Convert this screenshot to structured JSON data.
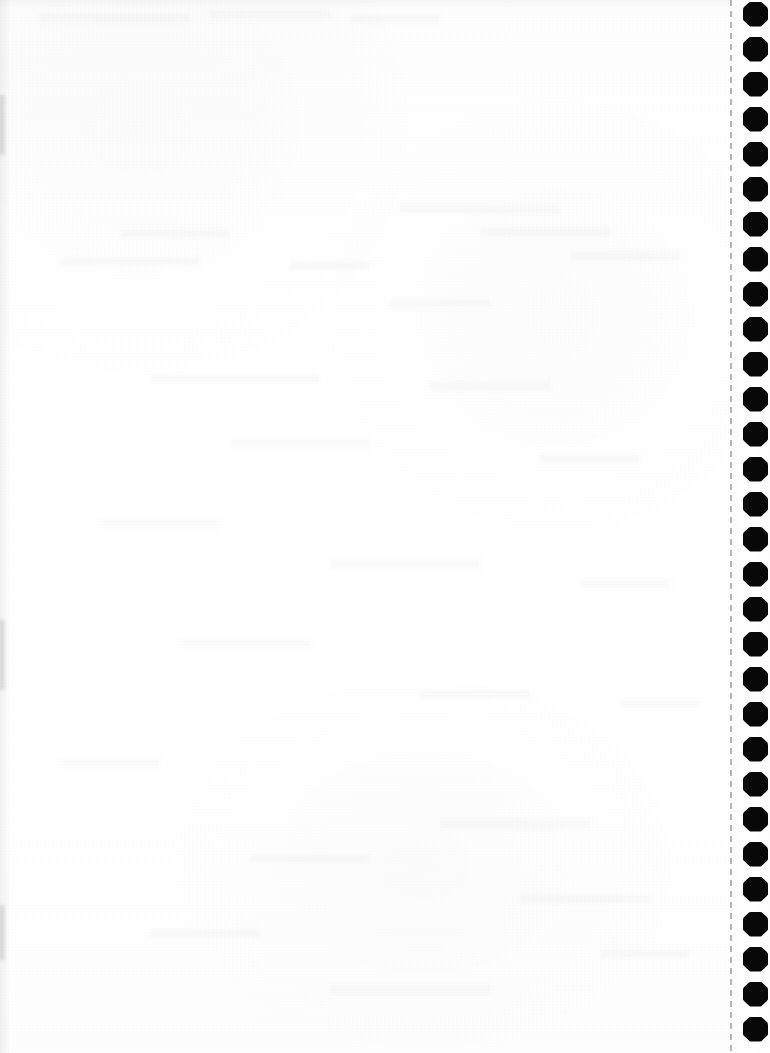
{
  "document": {
    "kind": "scanned-continuous-feed-paper",
    "title": "Blank Scanned Page",
    "page_width": 770,
    "page_height": 1053,
    "body_text": "",
    "visible_text": "",
    "notes_label": ""
  },
  "colors": {
    "paper": "#fefefe",
    "paper_shade": "#fdfdfd",
    "sprocket_hole": "#080808",
    "perforation": "#9a9a9a",
    "bleed_through": "rgba(120,120,130,0.035)"
  },
  "paper_body": {
    "name": "blank writing area",
    "left": 0,
    "top": 0,
    "width": 731,
    "height": 1053,
    "content": ""
  },
  "feed_strip": {
    "name": "tractor feed tear-off strip",
    "left": 731,
    "width": 39,
    "label": ""
  },
  "perforation": {
    "name": "dashed perforation line",
    "x": 730,
    "dash_length": 6,
    "gap_length": 5,
    "color": "#9a9a9a"
  },
  "sprockets": {
    "name": "sprocket feed holes",
    "count": 30,
    "left": 743,
    "size": 25,
    "pitch": 35,
    "first_center_y": 14,
    "centers_y": [
      14,
      49,
      84,
      119,
      154,
      189,
      224,
      259,
      294,
      329,
      364,
      399,
      434,
      469,
      504,
      539,
      574,
      609,
      644,
      679,
      714,
      749,
      784,
      819,
      854,
      889,
      924,
      959,
      994,
      1029
    ]
  },
  "bleed_through_marks": [
    {
      "left": 40,
      "top": 14,
      "width": 150,
      "height": 9
    },
    {
      "left": 210,
      "top": 10,
      "width": 120,
      "height": 8
    },
    {
      "left": 350,
      "top": 16,
      "width": 90,
      "height": 7
    },
    {
      "left": 400,
      "top": 205,
      "width": 160,
      "height": 8
    },
    {
      "left": 120,
      "top": 230,
      "width": 110,
      "height": 7
    },
    {
      "left": 480,
      "top": 228,
      "width": 130,
      "height": 8
    },
    {
      "left": 60,
      "top": 258,
      "width": 140,
      "height": 7
    },
    {
      "left": 290,
      "top": 262,
      "width": 80,
      "height": 7
    },
    {
      "left": 570,
      "top": 252,
      "width": 110,
      "height": 8
    },
    {
      "left": 390,
      "top": 300,
      "width": 100,
      "height": 7
    },
    {
      "left": 150,
      "top": 375,
      "width": 170,
      "height": 7
    },
    {
      "left": 430,
      "top": 382,
      "width": 120,
      "height": 8
    },
    {
      "left": 230,
      "top": 440,
      "width": 140,
      "height": 7
    },
    {
      "left": 540,
      "top": 455,
      "width": 100,
      "height": 7
    },
    {
      "left": 100,
      "top": 520,
      "width": 120,
      "height": 7
    },
    {
      "left": 330,
      "top": 560,
      "width": 150,
      "height": 8
    },
    {
      "left": 580,
      "top": 580,
      "width": 90,
      "height": 7
    },
    {
      "left": 180,
      "top": 640,
      "width": 130,
      "height": 7
    },
    {
      "left": 420,
      "top": 690,
      "width": 110,
      "height": 8
    },
    {
      "left": 620,
      "top": 700,
      "width": 80,
      "height": 7
    },
    {
      "left": 60,
      "top": 760,
      "width": 100,
      "height": 7
    },
    {
      "left": 440,
      "top": 820,
      "width": 150,
      "height": 8
    },
    {
      "left": 250,
      "top": 855,
      "width": 120,
      "height": 7
    },
    {
      "left": 520,
      "top": 895,
      "width": 130,
      "height": 8
    },
    {
      "left": 150,
      "top": 930,
      "width": 110,
      "height": 7
    },
    {
      "left": 600,
      "top": 950,
      "width": 90,
      "height": 7
    },
    {
      "left": 330,
      "top": 985,
      "width": 160,
      "height": 8
    }
  ],
  "edge_smudges": [
    {
      "top": 620,
      "height": 70
    },
    {
      "top": 905,
      "height": 55
    },
    {
      "top": 95,
      "height": 60
    }
  ]
}
